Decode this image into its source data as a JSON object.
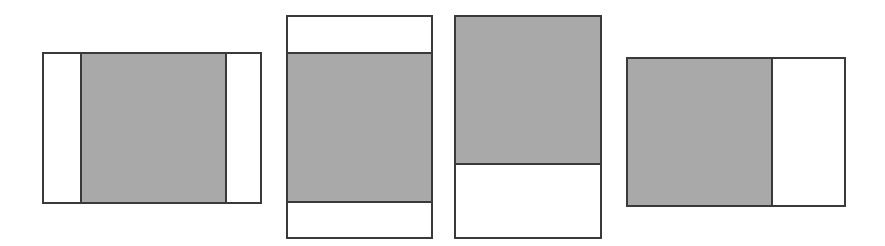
{
  "diagram": {
    "colors": {
      "border": "#3a3a3a",
      "fill": "#a9a9a9",
      "background": "#ffffff"
    },
    "frames": [
      {
        "id": "pillarbox",
        "x": 42,
        "y": 52,
        "w": 220,
        "h": 152,
        "fill": {
          "x": 38,
          "y": 0,
          "w": 145,
          "h": 152
        }
      },
      {
        "id": "letterbox",
        "x": 286,
        "y": 15,
        "w": 147,
        "h": 224,
        "fill": {
          "x": 0,
          "y": 37,
          "w": 147,
          "h": 150
        }
      },
      {
        "id": "top-aligned",
        "x": 454,
        "y": 15,
        "w": 148,
        "h": 224,
        "fill": {
          "x": 0,
          "y": 0,
          "w": 148,
          "h": 149
        }
      },
      {
        "id": "left-aligned",
        "x": 626,
        "y": 57,
        "w": 220,
        "h": 150,
        "fill": {
          "x": 0,
          "y": 0,
          "w": 146,
          "h": 150
        }
      }
    ]
  }
}
